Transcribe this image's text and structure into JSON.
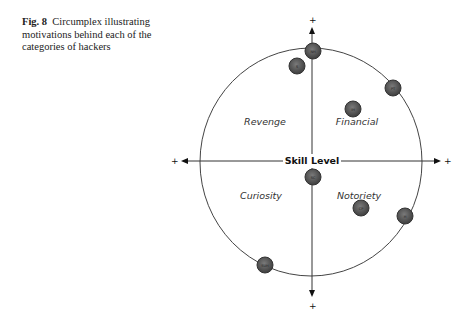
{
  "caption": {
    "fig_label": "Fig. 8",
    "text": "Circumplex illustrating motivations behind each of the categories of hackers"
  },
  "diagram": {
    "axis_label": "Skill Level",
    "plus_signs": {
      "top": "+",
      "bottom": "+",
      "left": "+",
      "right": "+"
    },
    "quadrants": {
      "top_left": "Revenge",
      "top_right": "Financial",
      "bottom_left": "Curiosity",
      "bottom_right": "Notoriety"
    },
    "nodes": [
      {
        "id": "n1",
        "label": "NH",
        "x": 313,
        "y": 51
      },
      {
        "id": "n2",
        "label": "S",
        "x": 297,
        "y": 66
      },
      {
        "id": "n3",
        "label": "PT",
        "x": 393,
        "y": 88
      },
      {
        "id": "n4",
        "label": "IH",
        "x": 353,
        "y": 109
      },
      {
        "id": "n5",
        "label": "SC",
        "x": 313,
        "y": 177
      },
      {
        "id": "n6",
        "label": "CP",
        "x": 361,
        "y": 208
      },
      {
        "id": "n7",
        "label": "H",
        "x": 405,
        "y": 216
      },
      {
        "id": "n8",
        "label": "SUH",
        "x": 265,
        "y": 265
      }
    ],
    "colors": {
      "node_fill": "#5a5a5a",
      "node_stroke": "#333333",
      "line": "#333333"
    }
  }
}
